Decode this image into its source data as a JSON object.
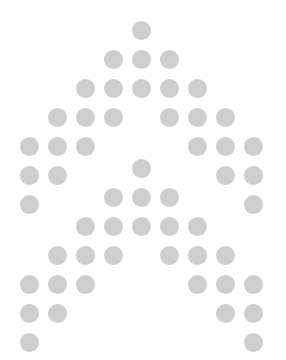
{
  "figure": {
    "dot_color": "#cecece",
    "dot_diameter": 19,
    "col_origin_x": 29,
    "col_spacing": 28,
    "row_spacing": 29,
    "glyphs": [
      {
        "name": "letter-a-upper",
        "origin_y": 30
      },
      {
        "name": "letter-a-lower",
        "origin_y": 168
      }
    ],
    "pattern": [
      [
        4
      ],
      [
        3,
        4,
        5
      ],
      [
        2,
        3,
        4,
        5,
        6
      ],
      [
        1,
        2,
        3,
        5,
        6,
        7
      ],
      [
        0,
        1,
        2,
        6,
        7,
        8
      ],
      [
        0,
        1,
        7,
        8
      ],
      [
        0,
        8
      ]
    ]
  }
}
